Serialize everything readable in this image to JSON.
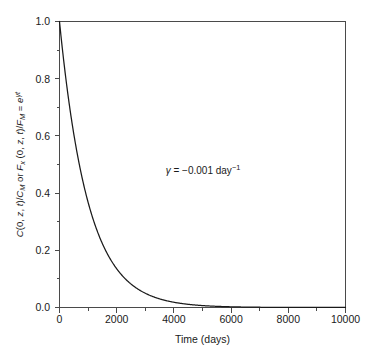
{
  "figure": {
    "background_color": "#ffffff",
    "axis_color": "#4a4a4a",
    "curve_color": "#1a1a1a",
    "text_color": "#1a1a1a"
  },
  "chart_data": {
    "type": "line",
    "title": "",
    "subtitle": "",
    "xlabel": "Time (days)",
    "ylabel": "C(0, z, t)/C_M or F_x (0, z, t)/F_M = e^{γt}",
    "ylabel_parts": {
      "p1_var": "C",
      "p1_args": "(0, ",
      "p1_z": "z",
      "p1_comma": ", ",
      "p1_t": "t",
      "p1_close": ")/",
      "p1_C": "C",
      "p1_Msub": "M",
      "p2_or": " or ",
      "p2_F": "F",
      "p2_xsub": "x",
      "p2_args": " (0, ",
      "p2_z": "z",
      "p2_comma": ", ",
      "p2_t": "t",
      "p2_close": ")/",
      "p2_F2": "F",
      "p2_Msub": "M",
      "p3_eq": " = ",
      "p3_e": "e",
      "p3_sup_gamma": "γ",
      "p3_sup_t": "t"
    },
    "xlim": [
      0,
      10000
    ],
    "ylim": [
      0.0,
      1.0
    ],
    "xticks": [
      0,
      2000,
      4000,
      6000,
      8000,
      10000
    ],
    "xticklabels": [
      "0",
      "2000",
      "4000",
      "6000",
      "8000",
      "10000"
    ],
    "xminorticks": [
      1000,
      3000,
      5000,
      7000,
      9000
    ],
    "yticks": [
      0.0,
      0.2,
      0.4,
      0.6,
      0.8,
      1.0
    ],
    "yticklabels": [
      "0.0",
      "0.2",
      "0.4",
      "0.6",
      "0.8",
      "1.0"
    ],
    "yminorticks": [
      0.1,
      0.3,
      0.5,
      0.7,
      0.9
    ],
    "grid": false,
    "legend": null,
    "annotations": [
      {
        "name": "decay-rate-annotation",
        "text": "γ = −0.001 day⁻¹",
        "parts": {
          "gamma": "γ",
          "equals": " = ",
          "value": "−0.001",
          "unit": " day",
          "exponent": "−1"
        },
        "x": 3300,
        "y": 0.5
      }
    ],
    "series": [
      {
        "name": "exponential decay e^(γt), γ = -0.001 /day",
        "gamma": -0.001,
        "formula": "y = exp(-0.001 * t)",
        "x": [
          0,
          250,
          500,
          750,
          1000,
          1250,
          1500,
          1750,
          2000,
          2250,
          2500,
          2750,
          3000,
          3250,
          3500,
          3750,
          4000,
          4250,
          4500,
          4750,
          5000,
          5250,
          5500,
          5750,
          6000,
          6250,
          6500,
          6750,
          7000,
          7500,
          8000,
          8500,
          9000,
          9500,
          10000
        ],
        "values": [
          1.0,
          0.779,
          0.607,
          0.472,
          0.368,
          0.287,
          0.223,
          0.174,
          0.135,
          0.105,
          0.082,
          0.064,
          0.05,
          0.039,
          0.03,
          0.024,
          0.018,
          0.014,
          0.011,
          0.0087,
          0.0067,
          0.0052,
          0.0041,
          0.0032,
          0.0025,
          0.0019,
          0.0015,
          0.0012,
          0.0009,
          0.00055,
          0.00034,
          0.0002,
          0.00012,
          7e-05,
          5e-05
        ]
      }
    ]
  }
}
